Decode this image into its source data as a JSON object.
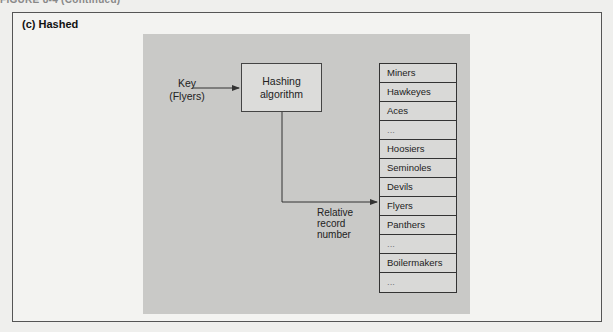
{
  "figure": {
    "header_cut": "FIGURE 8-4 (Continued)",
    "title": "(c) Hashed"
  },
  "diagram": {
    "key_label_line1": "Key",
    "key_label_line2": "(Flyers)",
    "hash_box_line1": "Hashing",
    "hash_box_line2": "algorithm",
    "rrn_line1": "Relative",
    "rrn_line2": "record",
    "rrn_line3": "number",
    "records": [
      "Miners",
      "Hawkeyes",
      "Aces",
      "...",
      "Hoosiers",
      "Seminoles",
      "Devils",
      "Flyers",
      "Panthers",
      "...",
      "Boilermakers",
      "..."
    ],
    "target_record": "Flyers"
  },
  "colors": {
    "panel": "#c9c9c7",
    "box_fill": "#dcdcda",
    "line": "#333333"
  }
}
